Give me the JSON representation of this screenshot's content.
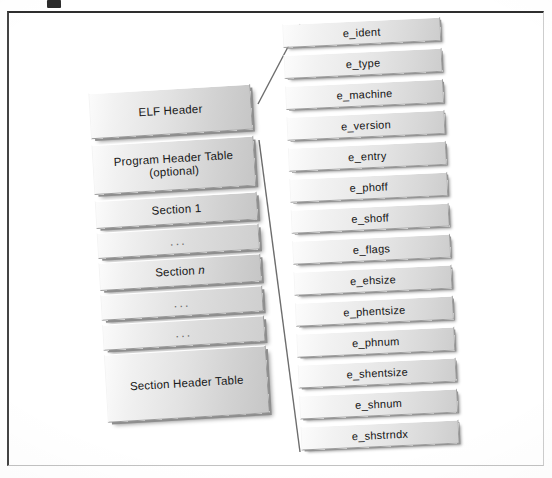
{
  "figure": {
    "background_color": "#ffffff",
    "frame_color": "#2e2e2e",
    "slab_fill_light": "#fbfbfb",
    "slab_fill_dark": "#c6c6c6",
    "slab_border_color": "#9a9a9a",
    "text_color": "#171717",
    "ellipsis": "..."
  },
  "file_layout": {
    "name": "elf-file-layout",
    "blocks": [
      {
        "id": "elf-header",
        "label": "ELF Header",
        "sublabel": ""
      },
      {
        "id": "program-header-table",
        "label": "Program Header Table",
        "sublabel": "(optional)"
      },
      {
        "id": "section-1",
        "label": "Section 1",
        "sublabel": ""
      },
      {
        "id": "dots-1",
        "label": "...",
        "sublabel": ""
      },
      {
        "id": "section-n",
        "label": "Section n",
        "sublabel": "",
        "italic_tail": "n",
        "label_head": "Section "
      },
      {
        "id": "dots-2",
        "label": "...",
        "sublabel": ""
      },
      {
        "id": "dots-3",
        "label": "...",
        "sublabel": ""
      },
      {
        "id": "section-header-table",
        "label": "Section Header Table",
        "sublabel": ""
      }
    ]
  },
  "elf_header_fields": {
    "name": "elf-header-field-list",
    "items": [
      {
        "id": "e-ident",
        "label": "e_ident"
      },
      {
        "id": "e-type",
        "label": "e_type"
      },
      {
        "id": "e-machine",
        "label": "e_machine"
      },
      {
        "id": "e-version",
        "label": "e_version"
      },
      {
        "id": "e-entry",
        "label": "e_entry"
      },
      {
        "id": "e-phoff",
        "label": "e_phoff"
      },
      {
        "id": "e-shoff",
        "label": "e_shoff"
      },
      {
        "id": "e-flags",
        "label": "e_flags"
      },
      {
        "id": "e-ehsize",
        "label": "e_ehsize"
      },
      {
        "id": "e-phentsize",
        "label": "e_phentsize"
      },
      {
        "id": "e-phnum",
        "label": "e_phnum"
      },
      {
        "id": "e-shentsize",
        "label": "e_shentsize"
      },
      {
        "id": "e-shnum",
        "label": "e_shnum"
      },
      {
        "id": "e-shstrndx",
        "label": "e_shstrndx"
      }
    ]
  },
  "callout": {
    "name": "elf-header-expansion-callout",
    "source_block": "ELF Header",
    "target_list": "elf-header-field-list",
    "line_color": "#6d6d6d"
  }
}
